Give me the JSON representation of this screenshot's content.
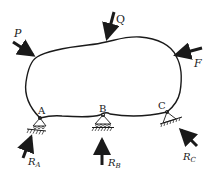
{
  "diagram": {
    "type": "free-body-diagram",
    "body": {
      "name": "rigid body"
    },
    "applied_forces": [
      {
        "id": "P",
        "label": "P"
      },
      {
        "id": "Q",
        "label": "Q"
      },
      {
        "id": "F",
        "label": "F"
      }
    ],
    "supports": [
      {
        "id": "A",
        "label": "A",
        "type": "roller",
        "reaction": {
          "label": "R",
          "subscript": "A"
        }
      },
      {
        "id": "B",
        "label": "B",
        "type": "roller",
        "reaction": {
          "label": "R",
          "subscript": "B"
        }
      },
      {
        "id": "C",
        "label": "C",
        "type": "inclined-surface",
        "reaction": {
          "label": "R",
          "subscript": "C"
        }
      }
    ],
    "colors": {
      "ink": "#1a1a1a",
      "background": "#ffffff"
    }
  }
}
